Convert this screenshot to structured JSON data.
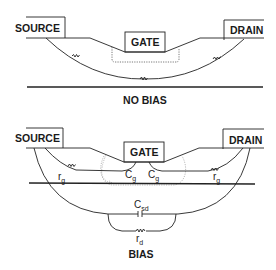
{
  "diagram": {
    "colors": {
      "line": "#222222",
      "background": "#ffffff",
      "dotted": "#888888"
    },
    "panels": [
      {
        "id": "no-bias",
        "caption": "NO BIAS",
        "terminals": {
          "source": "SOURCE",
          "gate": "GATE",
          "drain": "DRAIN"
        }
      },
      {
        "id": "bias",
        "caption": "BIAS",
        "terminals": {
          "source": "SOURCE",
          "gate": "GATE",
          "drain": "DRAIN"
        },
        "elements": {
          "rg_left": {
            "sym": "r",
            "sub": "g"
          },
          "cg_left": {
            "sym": "C",
            "sub": "g"
          },
          "cg_right": {
            "sym": "C",
            "sub": "g"
          },
          "rg_right": {
            "sym": "r",
            "sub": "g"
          },
          "csd": {
            "sym": "C",
            "sub": "sd"
          },
          "rd": {
            "sym": "r",
            "sub": "d"
          }
        }
      }
    ]
  }
}
